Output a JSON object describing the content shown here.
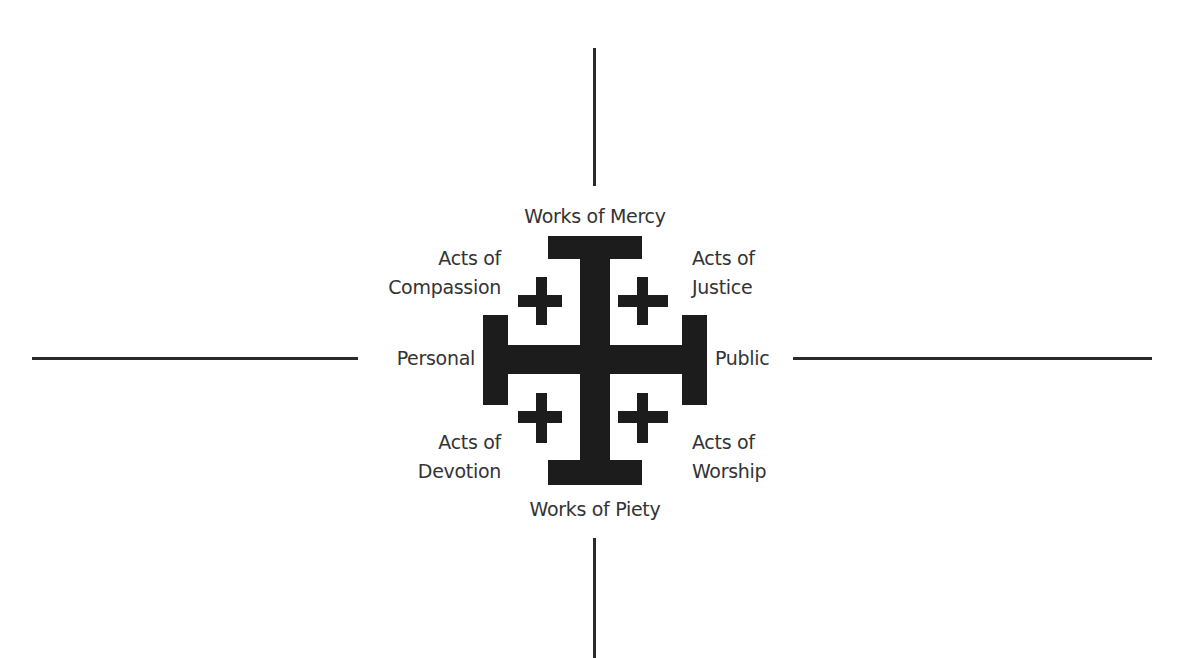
{
  "diagram": {
    "type": "jerusalem-cross-quadrant",
    "labels": {
      "top": "Works of Mercy",
      "bottom": "Works of Piety",
      "left": "Personal",
      "right": "Public",
      "top_left": [
        "Acts of",
        "Compassion"
      ],
      "top_right": [
        "Acts of",
        "Justice"
      ],
      "bottom_left": [
        "Acts of",
        "Devotion"
      ],
      "bottom_right": [
        "Acts of",
        "Worship"
      ]
    },
    "colors": {
      "background": "#ffffff",
      "cross": "#1c1c1c",
      "axis": "#2a2a2a",
      "text": "#333333"
    }
  }
}
